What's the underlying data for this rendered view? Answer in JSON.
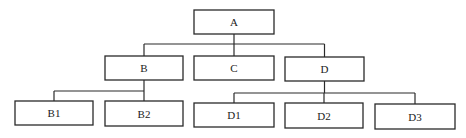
{
  "diagram": {
    "type": "tree",
    "nodes": [
      {
        "id": "A",
        "label": "A",
        "parent": null
      },
      {
        "id": "B",
        "label": "B",
        "parent": "A"
      },
      {
        "id": "C",
        "label": "C",
        "parent": "A"
      },
      {
        "id": "D",
        "label": "D",
        "parent": "A"
      },
      {
        "id": "B1",
        "label": "B1",
        "parent": "B"
      },
      {
        "id": "B2",
        "label": "B2",
        "parent": "B"
      },
      {
        "id": "D1",
        "label": "D1",
        "parent": "D"
      },
      {
        "id": "D2",
        "label": "D2",
        "parent": "D"
      },
      {
        "id": "D3",
        "label": "D3",
        "parent": "D"
      }
    ],
    "colors": {
      "line": "#2a2a2a",
      "box_fill": "#ffffff",
      "text": "#222222"
    }
  }
}
